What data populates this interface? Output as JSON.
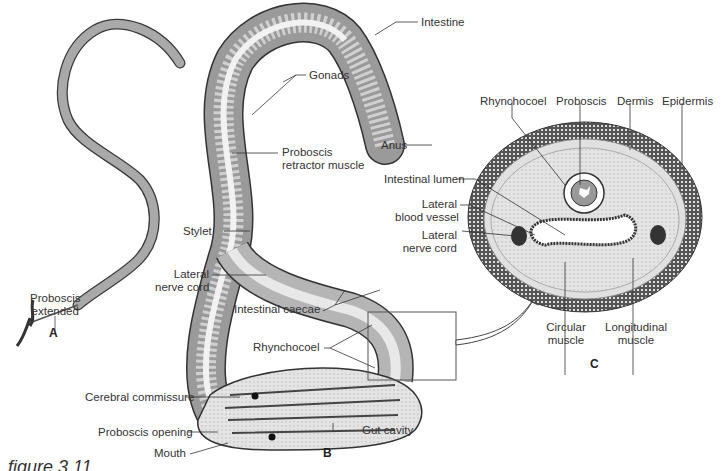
{
  "figure": {
    "caption_partial": "figure 3.11",
    "panels": {
      "a": "A",
      "b": "B",
      "c": "C"
    }
  },
  "panel_a": {
    "labels": {
      "proboscis_extended": [
        "Proboscis",
        "extended"
      ]
    }
  },
  "panel_b": {
    "labels": {
      "intestine": "Intestine",
      "gonads": "Gonads",
      "anus": "Anus",
      "proboscis_retractor_muscle": [
        "Proboscis",
        "retractor muscle"
      ],
      "stylet": "Stylet",
      "lateral_nerve_cord": [
        "Lateral",
        "nerve cord"
      ],
      "intestinal_caecae": "Intestinal caecae",
      "rhynchocoel": "Rhynchocoel",
      "cerebral_commissure": "Cerebral commissure",
      "proboscis_opening": "Proboscis opening",
      "mouth": "Mouth",
      "gut_cavity": "Gut cavity"
    }
  },
  "panel_c": {
    "labels": {
      "rhynchocoel": "Rhynchocoel",
      "proboscis": "Proboscis",
      "dermis": "Dermis",
      "epidermis": "Epidermis",
      "intestinal_lumen": "Intestinal lumen",
      "lateral_blood_vessel": [
        "Lateral",
        "blood vessel"
      ],
      "lateral_nerve_cord": [
        "Lateral",
        "nerve cord"
      ],
      "circular_muscle": [
        "Circular",
        "muscle"
      ],
      "longitudinal_muscle": [
        "Longitudinal",
        "muscle"
      ]
    }
  },
  "colors": {
    "body_gray": "#a9a9a9",
    "outline": "#3a3a3a",
    "tissue_light": "#d9d9d9",
    "epidermis_dark": "#4a4a4a"
  }
}
